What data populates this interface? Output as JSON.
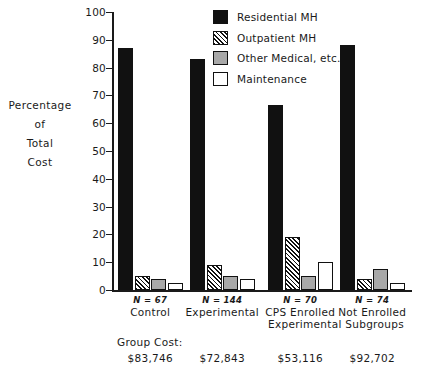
{
  "chart_data": {
    "type": "bar",
    "title": "",
    "xlabel": "Experimental Subgroups",
    "ylabel": "Percentage of Total Cost",
    "ylim": [
      0,
      100
    ],
    "ytick_labels": [
      "100",
      "90",
      "80",
      "70",
      "60",
      "50",
      "40",
      "30",
      "20",
      "10",
      "0"
    ],
    "ytick_values": [
      100,
      90,
      80,
      70,
      60,
      50,
      40,
      30,
      20,
      10,
      0
    ],
    "grid": false,
    "legend_position": "top-right",
    "categories": [
      "Control",
      "Experimental",
      "CPS Enrolled",
      "Not Enrolled"
    ],
    "category_n_labels": [
      "N = 67",
      "N = 144",
      "N = 70",
      "N = 74"
    ],
    "series": [
      {
        "name": "Residential MH",
        "fill": "solid-black",
        "values": [
          87,
          83,
          66.5,
          88
        ]
      },
      {
        "name": "Outpatient MH",
        "fill": "hatch",
        "values": [
          5,
          9,
          19,
          4
        ]
      },
      {
        "name": "Other Medical, etc.",
        "fill": "gray",
        "values": [
          4,
          5,
          5,
          7.5
        ]
      },
      {
        "name": "Maintenance",
        "fill": "white",
        "values": [
          2.5,
          4,
          10,
          2.5
        ]
      }
    ],
    "annotations": {
      "cost_caption": "Group Cost:",
      "group_costs": [
        "$83,746",
        "$72,843",
        "$53,116",
        "$92,702"
      ]
    },
    "colors": {
      "axis": "#111111",
      "residential": "#111111",
      "outpatient": "#111111",
      "other_medical": "#a8a8a8",
      "maintenance": "#ffffff",
      "background": "#ffffff"
    }
  },
  "axis": {
    "y_title_lines": [
      "Percentage",
      "of",
      "Total",
      "Cost"
    ]
  }
}
